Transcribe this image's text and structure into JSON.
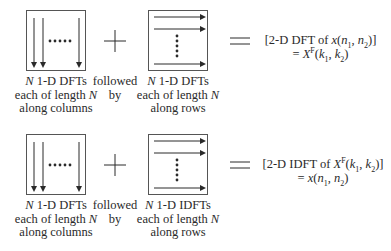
{
  "rows": [
    {
      "id": "forward",
      "step1": {
        "line1_prefix": "N",
        "line1_rest": " 1-D DFTs",
        "line2_prefix": "each of length ",
        "line2_var": "N",
        "line3": "along columns",
        "direction": "columns"
      },
      "connector": {
        "symbol": "+",
        "line1": "followed",
        "line2": "by"
      },
      "step2": {
        "line1_prefix": "N",
        "line1_rest": " 1-D DFTs",
        "line2_prefix": "each of length ",
        "line2_var": "N",
        "line3": "along rows",
        "direction": "rows"
      },
      "equals_symbol": "=",
      "result": {
        "line1": "[2-D DFT of x(n1, n2)]",
        "line2": "= XF(k1, k2)"
      }
    },
    {
      "id": "inverse",
      "step1": {
        "line1_prefix": "N",
        "line1_rest": " 1-D DFTs",
        "line2_prefix": "each of length ",
        "line2_var": "N",
        "line3": "along columns",
        "direction": "columns"
      },
      "connector": {
        "symbol": "+",
        "line1": "followed",
        "line2": "by"
      },
      "step2": {
        "line1_prefix": "N",
        "line1_rest": " 1-D IDFTs",
        "line2_prefix": "each of length ",
        "line2_var": "N",
        "line3": "along rows",
        "direction": "rows"
      },
      "equals_symbol": "=",
      "result": {
        "line1": "[2-D IDFT of XF(k1, k2)]",
        "line2": "= x(n1, n2)"
      }
    }
  ],
  "colors": {
    "stroke": "#2a2a2a",
    "box_border": "#555555",
    "background": "#ffffff"
  }
}
